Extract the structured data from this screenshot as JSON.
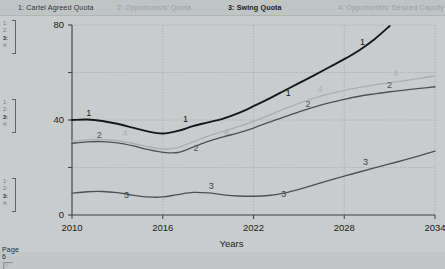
{
  "document": {
    "page_label": "Page 6",
    "rail_markers": [
      {
        "lines": [
          "1:",
          "2:",
          "3:",
          "4:"
        ]
      },
      {
        "lines": [
          "1:",
          "2:",
          "3:",
          "4:"
        ]
      },
      {
        "lines": [
          "1:",
          "2:",
          "3:",
          "4:"
        ]
      }
    ]
  },
  "legend": {
    "items": [
      {
        "id": "1",
        "label": "1: Cartel Agreed Quota",
        "color": "#2e3436"
      },
      {
        "id": "2",
        "label": "2: Opportunists' Quota",
        "color": "#9aa0a2"
      },
      {
        "id": "3",
        "label": "3: Swing Quota",
        "color": "#1b1f21"
      },
      {
        "id": "4",
        "label": "4: Opportunists' Desired Capcity",
        "color": "#9aa0a2"
      }
    ]
  },
  "chart_data": {
    "type": "line",
    "title": "",
    "xlabel": "Years",
    "ylabel": "",
    "xlim": [
      2010,
      2034
    ],
    "ylim": [
      0,
      80
    ],
    "xticks": [
      2010,
      2016,
      2022,
      2028,
      2034
    ],
    "yticks": [
      0,
      20,
      40,
      60,
      80
    ],
    "ytick_labels": [
      "0",
      "40",
      "80"
    ],
    "ytick_labels_shown": [
      0,
      40,
      80
    ],
    "grid": true,
    "grid_style": "dotted",
    "legend_position": "top",
    "series": [
      {
        "name": "Cartel Agreed Quota",
        "id": "1",
        "color": "#14181a",
        "width": 1.9,
        "x": [
          2010,
          2011,
          2012,
          2013,
          2014,
          2015,
          2016,
          2017,
          2018,
          2019,
          2020,
          2021,
          2022,
          2023,
          2024,
          2025,
          2026,
          2027,
          2028,
          2029,
          2030,
          2031
        ],
        "y": [
          40.0,
          40.2,
          39.6,
          38.4,
          36.8,
          35.2,
          34.3,
          35.4,
          37.4,
          39.0,
          40.6,
          42.9,
          45.8,
          48.9,
          52.2,
          55.5,
          58.8,
          62.2,
          65.6,
          69.4,
          74.0,
          79.6
        ],
        "labels": [
          {
            "text": "1",
            "x": 2011.1,
            "y": 41.6
          },
          {
            "text": "1",
            "x": 2017.5,
            "y": 39.0
          },
          {
            "text": "1",
            "x": 2024.3,
            "y": 50.2
          },
          {
            "text": "1",
            "x": 2029.2,
            "y": 71.5
          }
        ]
      },
      {
        "name": "Opportunists' Quota",
        "id": "2",
        "color": "#4b5254",
        "width": 1.35,
        "x": [
          2010,
          2011,
          2012,
          2013,
          2014,
          2015,
          2016,
          2017,
          2018,
          2019,
          2020,
          2021,
          2022,
          2023,
          2024,
          2025,
          2026,
          2027,
          2028,
          2029,
          2030,
          2031,
          2032,
          2033,
          2034
        ],
        "y": [
          30.2,
          30.8,
          30.9,
          30.4,
          29.2,
          27.6,
          26.4,
          26.3,
          28.6,
          31.0,
          32.9,
          34.6,
          36.6,
          39.0,
          41.2,
          43.4,
          45.4,
          47.2,
          48.7,
          50.0,
          51.0,
          51.9,
          52.6,
          53.3,
          54.0
        ],
        "labels": [
          {
            "text": "2",
            "x": 2011.8,
            "y": 32.5
          },
          {
            "text": "2",
            "x": 2018.2,
            "y": 27.0
          },
          {
            "text": "2",
            "x": 2025.6,
            "y": 45.3
          },
          {
            "text": "2",
            "x": 2031.0,
            "y": 53.6
          }
        ]
      },
      {
        "name": "Swing Quota",
        "id": "3",
        "color": "#4b5254",
        "width": 1.35,
        "x": [
          2010,
          2011,
          2012,
          2013,
          2014,
          2015,
          2016,
          2017,
          2018,
          2019,
          2020,
          2021,
          2022,
          2023,
          2024,
          2025,
          2026,
          2027,
          2028,
          2029,
          2030,
          2031,
          2032,
          2033,
          2034
        ],
        "y": [
          9.2,
          9.8,
          9.9,
          9.4,
          8.4,
          7.6,
          7.6,
          8.6,
          9.5,
          9.3,
          8.5,
          8.0,
          7.9,
          8.2,
          9.2,
          10.8,
          12.7,
          14.6,
          16.4,
          18.1,
          19.8,
          21.5,
          23.2,
          25.0,
          26.9
        ],
        "labels": [
          {
            "text": "3",
            "x": 2013.6,
            "y": 7.0
          },
          {
            "text": "3",
            "x": 2019.2,
            "y": 11.1
          },
          {
            "text": "3",
            "x": 2024.0,
            "y": 7.7
          },
          {
            "text": "3",
            "x": 2029.4,
            "y": 20.9
          }
        ]
      },
      {
        "name": "Opportunists' Desired Capcity",
        "id": "4",
        "color": "#a9afb1",
        "width": 1.35,
        "x": [
          2010,
          2011,
          2012,
          2013,
          2014,
          2015,
          2016,
          2017,
          2018,
          2019,
          2020,
          2021,
          2022,
          2023,
          2024,
          2025,
          2026,
          2027,
          2028,
          2029,
          2030,
          2031,
          2032,
          2033,
          2034
        ],
        "y": [
          31.0,
          31.6,
          31.8,
          31.3,
          30.2,
          28.8,
          27.8,
          28.4,
          30.8,
          33.2,
          35.2,
          37.2,
          39.4,
          42.0,
          44.6,
          47.0,
          49.2,
          51.0,
          52.5,
          53.7,
          54.8,
          55.7,
          56.6,
          57.5,
          58.6
        ],
        "labels": [
          {
            "text": "4",
            "x": 2013.5,
            "y": 33.4
          },
          {
            "text": "4",
            "x": 2020.2,
            "y": 33.6
          },
          {
            "text": "4",
            "x": 2026.4,
            "y": 51.9
          },
          {
            "text": "4",
            "x": 2031.4,
            "y": 58.7
          }
        ]
      }
    ]
  }
}
